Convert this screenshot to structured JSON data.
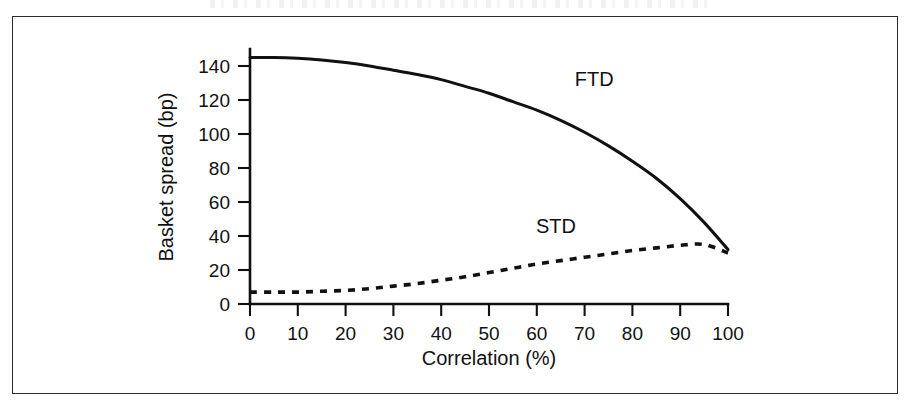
{
  "figure": {
    "background_color": "#ffffff",
    "frame_color": "#2b2b2b",
    "ink_color": "#111111"
  },
  "chart_data": {
    "type": "line",
    "title": "",
    "subtitle": "",
    "xlabel": "Correlation (%)",
    "ylabel": "Basket spread (bp)",
    "xlim": [
      0,
      100
    ],
    "ylim": [
      0,
      150
    ],
    "xticks": [
      0,
      10,
      20,
      30,
      40,
      50,
      60,
      70,
      80,
      90,
      100
    ],
    "xtick_labels": [
      "0",
      "10",
      "20",
      "30",
      "40",
      "50",
      "60",
      "70",
      "80",
      "90",
      "100"
    ],
    "yticks": [
      0,
      20,
      40,
      60,
      80,
      100,
      120,
      140
    ],
    "ytick_labels": [
      "0",
      "20",
      "40",
      "60",
      "80",
      "100",
      "120",
      "140"
    ],
    "grid": false,
    "legend": "inline-annotations",
    "annotations": [
      {
        "text": "FTD",
        "x": 72,
        "y": 128
      },
      {
        "text": "STD",
        "x": 64,
        "y": 42
      }
    ],
    "x": [
      0,
      5,
      10,
      15,
      20,
      25,
      30,
      35,
      40,
      45,
      50,
      55,
      60,
      65,
      70,
      75,
      80,
      85,
      90,
      95,
      100
    ],
    "series": [
      {
        "name": "FTD",
        "style": "solid",
        "values": [
          145,
          145,
          144.5,
          143.5,
          142,
          140,
          137.5,
          135,
          132,
          128,
          124,
          119,
          114,
          108,
          101,
          93,
          84,
          74,
          62,
          48,
          32
        ]
      },
      {
        "name": "STD",
        "style": "dashed",
        "values": [
          7,
          7,
          7,
          7.5,
          8,
          9,
          10.5,
          12,
          14,
          16,
          18.5,
          21,
          23.5,
          25.5,
          27.5,
          29.5,
          31.5,
          33,
          34.5,
          35,
          30
        ]
      }
    ]
  }
}
